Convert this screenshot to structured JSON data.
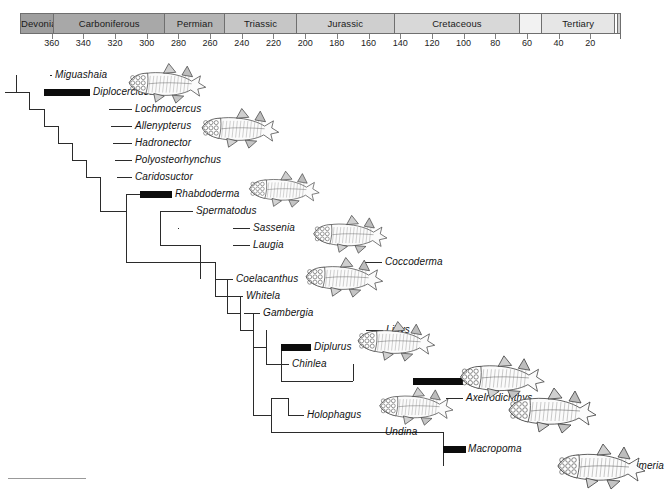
{
  "figure": {
    "axis_unit": "millions of years ago"
  },
  "timescale": {
    "periods": [
      {
        "name": "Devonian",
        "start": 380,
        "end": 359,
        "fill": "#9e9e9e"
      },
      {
        "name": "Carboniferous",
        "start": 359,
        "end": 289,
        "fill": "#a8a8a8"
      },
      {
        "name": "Permian",
        "start": 289,
        "end": 251,
        "fill": "#b4b4b4"
      },
      {
        "name": "Triassic",
        "start": 251,
        "end": 206,
        "fill": "#c6c6c6"
      },
      {
        "name": "Jurassic",
        "start": 206,
        "end": 144,
        "fill": "#cfcfcf"
      },
      {
        "name": "Cretaceous",
        "start": 144,
        "end": 65,
        "fill": "#d8d8d8"
      },
      {
        "name": "",
        "start": 65,
        "end": 51,
        "fill": "#f2f2f2"
      },
      {
        "name": "Tertiary",
        "start": 51,
        "end": 5,
        "fill": "#e6e6e6"
      },
      {
        "name": "",
        "start": 5,
        "end": 3,
        "fill": "#ffffff"
      },
      {
        "name": "",
        "start": 3,
        "end": 1,
        "fill": "#d0d0d0"
      }
    ],
    "ticks": [
      360,
      340,
      320,
      300,
      280,
      260,
      240,
      220,
      200,
      180,
      160,
      140,
      120,
      100,
      80,
      60,
      40,
      20
    ],
    "axis_min_ma": 380,
    "axis_max_ma": 0
  },
  "taxa": [
    {
      "name": "Miguashaia",
      "row": 0,
      "label_x": 55,
      "tip_x": 50,
      "bar": null
    },
    {
      "name": "Diplocercides",
      "row": 1,
      "label_x": 93,
      "tip_x": 44,
      "bar": {
        "x": 44,
        "w": 46
      }
    },
    {
      "name": "Lochmocercus",
      "row": 2,
      "label_x": 135,
      "tip_x": 109,
      "bar": null
    },
    {
      "name": "Allenypterus",
      "row": 3,
      "label_x": 135,
      "tip_x": 111,
      "bar": null
    },
    {
      "name": "Hadronector",
      "row": 4,
      "label_x": 135,
      "tip_x": 113,
      "bar": null
    },
    {
      "name": "Polyosteorhynchus",
      "row": 5,
      "label_x": 135,
      "tip_x": 115,
      "bar": null
    },
    {
      "name": "Caridosuctor",
      "row": 6,
      "label_x": 135,
      "tip_x": 117,
      "bar": null
    },
    {
      "name": "Rhabdoderma",
      "row": 7,
      "label_x": 175,
      "tip_x": 140,
      "bar": {
        "x": 140,
        "w": 32
      }
    },
    {
      "name": "Spermatodus",
      "row": 8,
      "label_x": 196,
      "tip_x": 178,
      "bar": null
    },
    {
      "name": "Sassenia",
      "row": 9,
      "label_x": 253,
      "tip_x": 233,
      "bar": null
    },
    {
      "name": "Laugia",
      "row": 10,
      "label_x": 253,
      "tip_x": 233,
      "bar": null
    },
    {
      "name": "Coccoderma",
      "row": 11,
      "label_x": 385,
      "tip_x": 365,
      "bar": null
    },
    {
      "name": "Coelacanthus",
      "row": 12,
      "label_x": 236,
      "tip_x": 215,
      "bar": null
    },
    {
      "name": "Whitela",
      "row": 13,
      "label_x": 246,
      "tip_x": 227,
      "bar": null
    },
    {
      "name": "Gambergia",
      "row": 14,
      "label_x": 263,
      "tip_x": 244,
      "bar": null
    },
    {
      "name": "Libys",
      "row": 15,
      "label_x": 386,
      "tip_x": 366,
      "bar": null
    },
    {
      "name": "Diplurus",
      "row": 16,
      "label_x": 314,
      "tip_x": 281,
      "bar": {
        "x": 281,
        "w": 30
      }
    },
    {
      "name": "Chinlea",
      "row": 17,
      "label_x": 292,
      "tip_x": 274,
      "bar": null
    },
    {
      "name": "Mawsonia",
      "row": 18,
      "label_x": 466,
      "tip_x": 413,
      "bar": {
        "x": 413,
        "w": 50
      }
    },
    {
      "name": "Axelrodichthys",
      "row": 19,
      "label_x": 466,
      "tip_x": 446,
      "bar": null
    },
    {
      "name": "Holophagus",
      "row": 20,
      "label_x": 307,
      "tip_x": 288,
      "bar": null
    },
    {
      "name": "Undina",
      "row": 21,
      "label_x": 385,
      "tip_x": 366,
      "bar": null
    },
    {
      "name": "Macropoma",
      "row": 22,
      "label_x": 468,
      "tip_x": 443,
      "bar": {
        "x": 443,
        "w": 23
      }
    },
    {
      "name": "Latimeria",
      "row": 23,
      "label_x": 622,
      "tip_x": 603,
      "bar": null
    }
  ],
  "illustrations": [
    {
      "taxon": "Miguashaia",
      "x": 118,
      "y": 60,
      "w": 98,
      "h": 44
    },
    {
      "taxon": "Allenypterus",
      "x": 196,
      "y": 104,
      "w": 88,
      "h": 46
    },
    {
      "taxon": "Rhabdoderma",
      "x": 236,
      "y": 168,
      "w": 96,
      "h": 40
    },
    {
      "taxon": "Sassenia",
      "x": 304,
      "y": 212,
      "w": 92,
      "h": 42
    },
    {
      "taxon": "Coelacanthus",
      "x": 298,
      "y": 254,
      "w": 92,
      "h": 44
    },
    {
      "taxon": "Diplurus",
      "x": 348,
      "y": 318,
      "w": 96,
      "h": 44
    },
    {
      "taxon": "Axelrodichthys",
      "x": 450,
      "y": 352,
      "w": 104,
      "h": 48
    },
    {
      "taxon": "Holophagus",
      "x": 368,
      "y": 384,
      "w": 96,
      "h": 42
    },
    {
      "taxon": "Macropoma",
      "x": 496,
      "y": 384,
      "w": 112,
      "h": 50
    },
    {
      "taxon": "Latimeria",
      "x": 546,
      "y": 440,
      "w": 110,
      "h": 50
    }
  ],
  "tree_nodes": [
    {
      "id": "root",
      "x": 16,
      "y_top": 75,
      "y_bot": 92,
      "stem_from": 5,
      "stem_y": 92
    },
    {
      "id": "n2",
      "x": 29,
      "y_top": 92,
      "y_bot": 109,
      "stem_from": 16,
      "stem_y": 92
    },
    {
      "id": "n3",
      "x": 44,
      "y_top": 109,
      "y_bot": 126,
      "stem_from": 29,
      "stem_y": 109
    },
    {
      "id": "n4",
      "x": 58,
      "y_top": 126,
      "y_bot": 143,
      "stem_from": 44,
      "stem_y": 126
    },
    {
      "id": "n5",
      "x": 72,
      "y_top": 143,
      "y_bot": 160,
      "stem_from": 58,
      "stem_y": 143
    },
    {
      "id": "n6",
      "x": 86,
      "y_top": 160,
      "y_bot": 177,
      "stem_from": 72,
      "stem_y": 160
    },
    {
      "id": "n7",
      "x": 100,
      "y_top": 177,
      "y_bot": 211,
      "stem_from": 86,
      "stem_y": 177
    },
    {
      "id": "n8",
      "x": 126,
      "y_top": 194,
      "y_bot": 262,
      "stem_from": 100,
      "stem_y": 211
    },
    {
      "id": "n9",
      "x": 160,
      "y_top": 211,
      "y_bot": 245,
      "stem_from": 126,
      "stem_y": 194
    },
    {
      "id": "n10",
      "x": 178,
      "y_top": 228,
      "y_bot": 228,
      "stem_from": 160,
      "stem_y": 211
    },
    {
      "id": "n11",
      "x": 200,
      "y_top": 245,
      "y_bot": 279,
      "stem_from": 160,
      "stem_y": 245
    },
    {
      "id": "n12",
      "x": 215,
      "y_top": 262,
      "y_bot": 296,
      "stem_from": 126,
      "stem_y": 262
    },
    {
      "id": "n13",
      "x": 227,
      "y_top": 279,
      "y_bot": 313,
      "stem_from": 215,
      "stem_y": 296
    },
    {
      "id": "n14",
      "x": 240,
      "y_top": 296,
      "y_bot": 330,
      "stem_from": 227,
      "stem_y": 313
    },
    {
      "id": "n15",
      "x": 253,
      "y_top": 313,
      "y_bot": 415,
      "stem_from": 240,
      "stem_y": 330
    },
    {
      "id": "n16",
      "x": 266,
      "y_top": 330,
      "y_bot": 364,
      "stem_from": 253,
      "stem_y": 347
    },
    {
      "id": "n17",
      "x": 281,
      "y_top": 347,
      "y_bot": 381,
      "stem_from": 266,
      "stem_y": 364
    },
    {
      "id": "n18",
      "x": 353,
      "y_top": 364,
      "y_bot": 381,
      "stem_from": 281,
      "stem_y": 381
    },
    {
      "id": "n19",
      "x": 271,
      "y_top": 398,
      "y_bot": 432,
      "stem_from": 253,
      "stem_y": 415
    },
    {
      "id": "n20",
      "x": 288,
      "y_top": 398,
      "y_bot": 415,
      "stem_from": 271,
      "stem_y": 398
    },
    {
      "id": "n21",
      "x": 443,
      "y_top": 432,
      "y_bot": 466,
      "stem_from": 271,
      "stem_y": 432
    }
  ],
  "colors": {
    "branch": "#2b2b2b",
    "range_bar": "#0c0c0c",
    "scale_border": "#6f6f6f",
    "text": "#121212"
  }
}
